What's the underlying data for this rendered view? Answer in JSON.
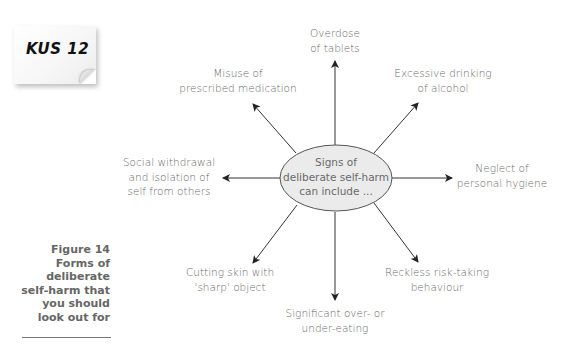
{
  "note": {
    "label": "KUS 12"
  },
  "caption": {
    "lines": [
      "Figure 14",
      "Forms of",
      "deliberate",
      "self-harm that",
      "you should",
      "look out for"
    ]
  },
  "diagram": {
    "center": {
      "line1": "Signs of",
      "line2": "deliberate self-harm",
      "line3": "can include ..."
    },
    "colors": {
      "line": "#333333",
      "ellipse_fill": "#ebebeb",
      "ellipse_stroke": "#555555",
      "text": "#6a6a6a"
    },
    "nodes": [
      {
        "id": "overdose",
        "line1": "Overdose",
        "line2": "of tablets"
      },
      {
        "id": "misuse",
        "line1": "Misuse of",
        "line2": "prescribed medication"
      },
      {
        "id": "alcohol",
        "line1": "Excessive drinking",
        "line2": "of alcohol"
      },
      {
        "id": "social",
        "line1": "Social withdrawal",
        "line2": "and isolation of",
        "line3": "self from others"
      },
      {
        "id": "hygiene",
        "line1": "Neglect of",
        "line2": "personal hygiene"
      },
      {
        "id": "cutting",
        "line1": "Cutting skin with",
        "line2": "'sharp' object"
      },
      {
        "id": "eating",
        "line1": "Significant over- or",
        "line2": "under-eating"
      },
      {
        "id": "reckless",
        "line1": "Reckless risk-taking",
        "line2": "behaviour"
      }
    ]
  }
}
